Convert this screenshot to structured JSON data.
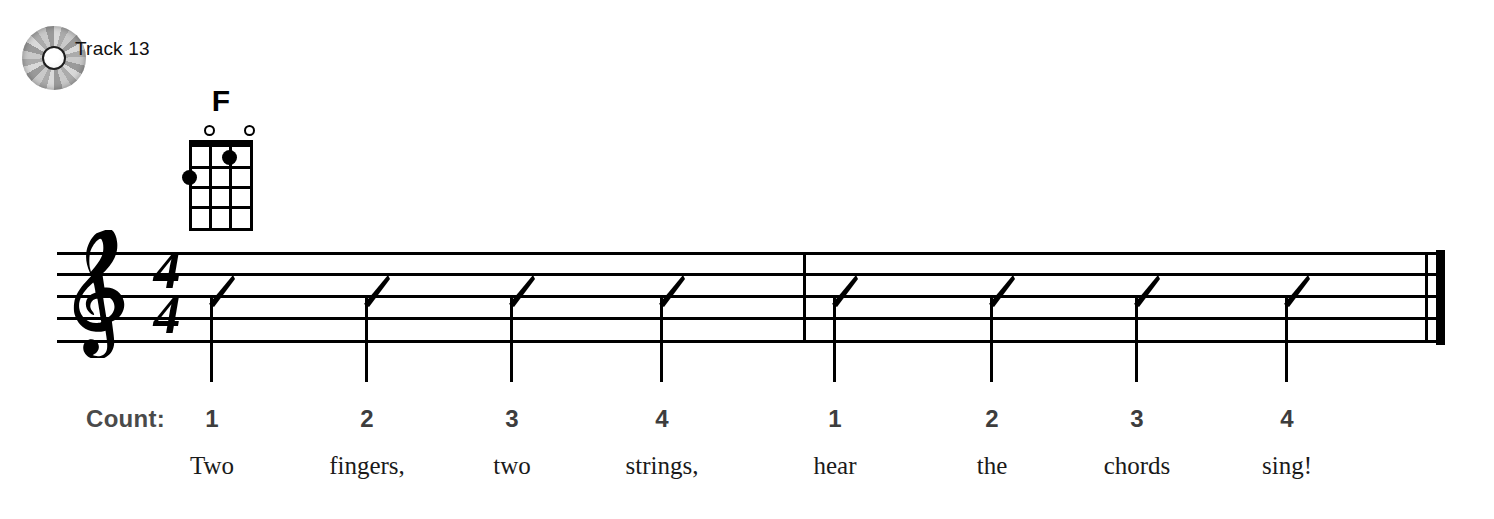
{
  "track": {
    "label": "Track 13",
    "icon": "cd-icon"
  },
  "chord": {
    "name": "F",
    "instrument": "ukulele",
    "strings": 4,
    "frets": 4,
    "open_strings": [
      1,
      3
    ],
    "fingerings": [
      {
        "string": 3,
        "fret": 1
      },
      {
        "string": 1,
        "fret": 2
      }
    ]
  },
  "staff": {
    "clef": "treble-clef",
    "time_signature": {
      "beats": "4",
      "beat_value": "4"
    },
    "barline_middle": "single",
    "barline_end": "final-double",
    "notation": "rhythm-slashes"
  },
  "count_label": "Count:",
  "measures": [
    {
      "beats": [
        {
          "count": "1",
          "lyric": "Two"
        },
        {
          "count": "2",
          "lyric": "fingers,"
        },
        {
          "count": "3",
          "lyric": "two"
        },
        {
          "count": "4",
          "lyric": "strings,"
        }
      ]
    },
    {
      "beats": [
        {
          "count": "1",
          "lyric": "hear"
        },
        {
          "count": "2",
          "lyric": "the"
        },
        {
          "count": "3",
          "lyric": "chords"
        },
        {
          "count": "4",
          "lyric": "sing!"
        }
      ]
    }
  ],
  "colors": {
    "ink": "#000000",
    "count_gray": "#4a4a4a",
    "paper": "#ffffff"
  }
}
